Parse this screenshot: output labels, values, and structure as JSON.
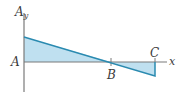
{
  "diagram": {
    "type": "shear-diagram",
    "labels": {
      "vertical_axis": "A",
      "vertical_axis_sub": "y",
      "origin": "A",
      "point_b": "B",
      "point_c": "C",
      "horizontal_axis": "x"
    },
    "colors": {
      "axis": "#7a7a7a",
      "line": "#2a8ab0",
      "fill": "#bfe0f0",
      "text": "#3a3a3a"
    }
  }
}
